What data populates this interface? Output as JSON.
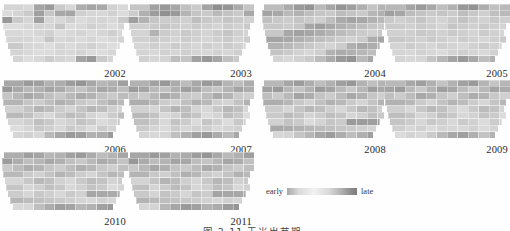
{
  "figure": {
    "caption": "图 2-11   玉米出苗期",
    "legend": {
      "low_label": "early",
      "high_label": "late",
      "ramp_low_color": "#e8e8e8",
      "ramp_high_color": "#7c7c7c"
    },
    "region_name": "Iowa",
    "panel_count": 10
  },
  "chart_data": {
    "type": "heatmap",
    "title": "图 2-11   玉米出苗期",
    "xlabel": "",
    "ylabel": "",
    "legend": {
      "position": "bottom-right",
      "entries": [
        "early",
        "late"
      ]
    },
    "colorbar": {
      "min_label": "early",
      "max_label": "late",
      "min_color": "#e8e8e8",
      "max_color": "#7c7c7c",
      "scale": "sequential-gray"
    },
    "grid": false,
    "panels": [
      {
        "label": "2002",
        "row": 0,
        "col": 0
      },
      {
        "label": "2003",
        "row": 0,
        "col": 1
      },
      {
        "label": "2004",
        "row": 0,
        "col": 2
      },
      {
        "label": "2005",
        "row": 0,
        "col": 3
      },
      {
        "label": "2006",
        "row": 1,
        "col": 0
      },
      {
        "label": "2007",
        "row": 1,
        "col": 1
      },
      {
        "label": "2008",
        "row": 1,
        "col": 2
      },
      {
        "label": "2009",
        "row": 1,
        "col": 3
      },
      {
        "label": "2010",
        "row": 2,
        "col": 0
      },
      {
        "label": "2011",
        "row": 2,
        "col": 1
      }
    ],
    "cell_values": {
      "2002": [
        0.28,
        0.22,
        0.18,
        0.62,
        0.7,
        0.3,
        0.2,
        0.55,
        0.62,
        0.58,
        0.24,
        0.18,
        0.16,
        0.22,
        0.3,
        0.66,
        0.34,
        0.58,
        0.6,
        0.26,
        0.2,
        0.18,
        0.24,
        0.16,
        0.72,
        0.3,
        0.22,
        0.64,
        0.2,
        0.18,
        0.26,
        0.16,
        0.2,
        0.22,
        0.18,
        0.3,
        0.24,
        0.14,
        0.18,
        0.22,
        0.2,
        0.34,
        0.16,
        0.18,
        0.26,
        0.2,
        0.16,
        0.22,
        0.58,
        0.18,
        0.16,
        0.2,
        0.24,
        0.14,
        0.18,
        0.22,
        0.16,
        0.2,
        0.26,
        0.18,
        0.14,
        0.22,
        0.2,
        0.16,
        0.34,
        0.18,
        0.22,
        0.16,
        0.2,
        0.14,
        0.18,
        0.22,
        0.16,
        0.3,
        0.2,
        0.18,
        0.14,
        0.22,
        0.16,
        0.2,
        0.24,
        0.18,
        0.14,
        0.16,
        0.2,
        0.22,
        0.18,
        0.14,
        0.16,
        0.2,
        0.18,
        0.22,
        0.16,
        0.14,
        0.2,
        0.18,
        0.16,
        0.22,
        0.14,
        0.18
      ],
      "2003": [
        0.4,
        0.34,
        0.64,
        0.72,
        0.6,
        0.38,
        0.3,
        0.62,
        0.8,
        0.74,
        0.56,
        0.34,
        0.28,
        0.52,
        0.68,
        0.78,
        0.7,
        0.48,
        0.34,
        0.3,
        0.44,
        0.36,
        0.3,
        0.58,
        0.66,
        0.5,
        0.34,
        0.28,
        0.3,
        0.26,
        0.4,
        0.32,
        0.28,
        0.34,
        0.3,
        0.24,
        0.28,
        0.26,
        0.3,
        0.34,
        0.28,
        0.24,
        0.3,
        0.26,
        0.22,
        0.28,
        0.24,
        0.3,
        0.26,
        0.22,
        0.5,
        0.28,
        0.24,
        0.3,
        0.26,
        0.22,
        0.28,
        0.34,
        0.26,
        0.22,
        0.28,
        0.24,
        0.3,
        0.26,
        0.22,
        0.28,
        0.24,
        0.2,
        0.26,
        0.3,
        0.22,
        0.28,
        0.24,
        0.2,
        0.26,
        0.22,
        0.28,
        0.24,
        0.2,
        0.26,
        0.22,
        0.28,
        0.24,
        0.2,
        0.26,
        0.22,
        0.18,
        0.24,
        0.2,
        0.26,
        0.22,
        0.18,
        0.24,
        0.2,
        0.26,
        0.22,
        0.18,
        0.24,
        0.2,
        0.22
      ],
      "2004": [
        0.3,
        0.42,
        0.56,
        0.7,
        0.76,
        0.44,
        0.6,
        0.74,
        0.66,
        0.52,
        0.36,
        0.48,
        0.62,
        0.58,
        0.44,
        0.5,
        0.4,
        0.34,
        0.3,
        0.42,
        0.36,
        0.3,
        0.46,
        0.52,
        0.38,
        0.32,
        0.28,
        0.34,
        0.3,
        0.26,
        0.4,
        0.56,
        0.62,
        0.58,
        0.5,
        0.44,
        0.38,
        0.32,
        0.28,
        0.34,
        0.6,
        0.66,
        0.58,
        0.52,
        0.46,
        0.4,
        0.34,
        0.3,
        0.26,
        0.32,
        0.58,
        0.64,
        0.6,
        0.54,
        0.48,
        0.42,
        0.36,
        0.3,
        0.26,
        0.32,
        0.56,
        0.62,
        0.58,
        0.52,
        0.46,
        0.4,
        0.34,
        0.28,
        0.24,
        0.3,
        0.54,
        0.6,
        0.56,
        0.5,
        0.44,
        0.38,
        0.32,
        0.26,
        0.22,
        0.28,
        0.52,
        0.58,
        0.54,
        0.48,
        0.42,
        0.36,
        0.3,
        0.24,
        0.2,
        0.26,
        0.5,
        0.56,
        0.52,
        0.46,
        0.4,
        0.34,
        0.28,
        0.22,
        0.18,
        0.24
      ],
      "2005": [
        0.34,
        0.46,
        0.62,
        0.7,
        0.58,
        0.4,
        0.52,
        0.72,
        0.76,
        0.54,
        0.38,
        0.44,
        0.66,
        0.6,
        0.42,
        0.36,
        0.3,
        0.34,
        0.28,
        0.4,
        0.32,
        0.26,
        0.38,
        0.44,
        0.3,
        0.24,
        0.28,
        0.34,
        0.26,
        0.22,
        0.3,
        0.36,
        0.28,
        0.24,
        0.32,
        0.26,
        0.22,
        0.28,
        0.24,
        0.3,
        0.26,
        0.22,
        0.34,
        0.28,
        0.24,
        0.3,
        0.26,
        0.22,
        0.28,
        0.24,
        0.26,
        0.32,
        0.28,
        0.24,
        0.3,
        0.26,
        0.22,
        0.28,
        0.24,
        0.2,
        0.26,
        0.32,
        0.28,
        0.24,
        0.3,
        0.26,
        0.22,
        0.28,
        0.24,
        0.2,
        0.26,
        0.3,
        0.26,
        0.22,
        0.28,
        0.24,
        0.2,
        0.26,
        0.22,
        0.18,
        0.24,
        0.28,
        0.24,
        0.2,
        0.26,
        0.22,
        0.18,
        0.24,
        0.2,
        0.16,
        0.22,
        0.26,
        0.22,
        0.18,
        0.24,
        0.2,
        0.16,
        0.22,
        0.18,
        0.2
      ],
      "2006": [
        0.44,
        0.58,
        0.7,
        0.66,
        0.5,
        0.54,
        0.68,
        0.74,
        0.6,
        0.46,
        0.52,
        0.64,
        0.72,
        0.58,
        0.44,
        0.5,
        0.62,
        0.56,
        0.42,
        0.36,
        0.48,
        0.6,
        0.54,
        0.4,
        0.34,
        0.46,
        0.58,
        0.52,
        0.38,
        0.32,
        0.44,
        0.56,
        0.5,
        0.36,
        0.3,
        0.42,
        0.54,
        0.48,
        0.34,
        0.28,
        0.4,
        0.52,
        0.46,
        0.32,
        0.26,
        0.38,
        0.5,
        0.44,
        0.3,
        0.24,
        0.36,
        0.48,
        0.42,
        0.28,
        0.22,
        0.34,
        0.46,
        0.4,
        0.26,
        0.2,
        0.32,
        0.44,
        0.38,
        0.24,
        0.18,
        0.3,
        0.42,
        0.36,
        0.22,
        0.16,
        0.28,
        0.4,
        0.34,
        0.2,
        0.26,
        0.38,
        0.32,
        0.18,
        0.24,
        0.36,
        0.3,
        0.16,
        0.22,
        0.34,
        0.28,
        0.14,
        0.2,
        0.32,
        0.26,
        0.18,
        0.3,
        0.24,
        0.16,
        0.28,
        0.22,
        0.14,
        0.26,
        0.2,
        0.24,
        0.18
      ],
      "2007": [
        0.38,
        0.5,
        0.64,
        0.72,
        0.56,
        0.42,
        0.58,
        0.7,
        0.66,
        0.48,
        0.4,
        0.54,
        0.68,
        0.62,
        0.44,
        0.38,
        0.52,
        0.66,
        0.58,
        0.4,
        0.34,
        0.48,
        0.62,
        0.54,
        0.36,
        0.3,
        0.44,
        0.58,
        0.5,
        0.32,
        0.28,
        0.42,
        0.56,
        0.48,
        0.3,
        0.26,
        0.4,
        0.54,
        0.46,
        0.28,
        0.24,
        0.38,
        0.52,
        0.44,
        0.26,
        0.22,
        0.36,
        0.5,
        0.42,
        0.24,
        0.2,
        0.34,
        0.48,
        0.4,
        0.22,
        0.18,
        0.32,
        0.46,
        0.38,
        0.2,
        0.26,
        0.44,
        0.36,
        0.18,
        0.24,
        0.42,
        0.34,
        0.16,
        0.22,
        0.4,
        0.32,
        0.14,
        0.2,
        0.38,
        0.3,
        0.18,
        0.36,
        0.28,
        0.16,
        0.34,
        0.26,
        0.14,
        0.32,
        0.24,
        0.18,
        0.3,
        0.22,
        0.16,
        0.28,
        0.2,
        0.24,
        0.26,
        0.18,
        0.22,
        0.24,
        0.16,
        0.2,
        0.22,
        0.18,
        0.2
      ],
      "2008": [
        0.34,
        0.46,
        0.6,
        0.68,
        0.54,
        0.4,
        0.52,
        0.66,
        0.72,
        0.5,
        0.38,
        0.48,
        0.64,
        0.7,
        0.46,
        0.36,
        0.5,
        0.68,
        0.62,
        0.44,
        0.32,
        0.46,
        0.66,
        0.58,
        0.4,
        0.3,
        0.44,
        0.62,
        0.54,
        0.36,
        0.28,
        0.42,
        0.58,
        0.5,
        0.34,
        0.26,
        0.4,
        0.54,
        0.46,
        0.32,
        0.24,
        0.38,
        0.5,
        0.44,
        0.3,
        0.22,
        0.36,
        0.48,
        0.42,
        0.28,
        0.2,
        0.34,
        0.46,
        0.4,
        0.26,
        0.18,
        0.32,
        0.44,
        0.38,
        0.24,
        0.16,
        0.3,
        0.42,
        0.36,
        0.22,
        0.28,
        0.4,
        0.34,
        0.2,
        0.26,
        0.38,
        0.32,
        0.18,
        0.24,
        0.36,
        0.3,
        0.16,
        0.22,
        0.34,
        0.28,
        0.7,
        0.68,
        0.66,
        0.64,
        0.62,
        0.58,
        0.54,
        0.5,
        0.46,
        0.42,
        0.38,
        0.34,
        0.3,
        0.26,
        0.22,
        0.18,
        0.24,
        0.2,
        0.22
      ],
      "2009": [
        0.3,
        0.44,
        0.58,
        0.66,
        0.52,
        0.36,
        0.5,
        0.64,
        0.7,
        0.48,
        0.34,
        0.46,
        0.62,
        0.68,
        0.44,
        0.32,
        0.48,
        0.66,
        0.6,
        0.42,
        0.3,
        0.44,
        0.62,
        0.56,
        0.38,
        0.28,
        0.42,
        0.58,
        0.52,
        0.34,
        0.26,
        0.4,
        0.54,
        0.48,
        0.32,
        0.24,
        0.38,
        0.5,
        0.44,
        0.3,
        0.22,
        0.36,
        0.48,
        0.42,
        0.28,
        0.2,
        0.34,
        0.46,
        0.4,
        0.26,
        0.18,
        0.32,
        0.44,
        0.38,
        0.24,
        0.16,
        0.3,
        0.42,
        0.36,
        0.22,
        0.28,
        0.4,
        0.34,
        0.2,
        0.26,
        0.38,
        0.32,
        0.18,
        0.24,
        0.36,
        0.3,
        0.16,
        0.22,
        0.34,
        0.28,
        0.2,
        0.32,
        0.26,
        0.18,
        0.3,
        0.24,
        0.16,
        0.28,
        0.22,
        0.2,
        0.26,
        0.18,
        0.24,
        0.16,
        0.22,
        0.2,
        0.18,
        0.24,
        0.16,
        0.22,
        0.18,
        0.2,
        0.16,
        0.22,
        0.18
      ],
      "2010": [
        0.4,
        0.54,
        0.66,
        0.62,
        0.46,
        0.5,
        0.64,
        0.7,
        0.56,
        0.42,
        0.48,
        0.6,
        0.68,
        0.54,
        0.4,
        0.46,
        0.58,
        0.52,
        0.38,
        0.32,
        0.44,
        0.56,
        0.5,
        0.36,
        0.3,
        0.42,
        0.54,
        0.48,
        0.34,
        0.28,
        0.4,
        0.52,
        0.46,
        0.32,
        0.26,
        0.38,
        0.5,
        0.44,
        0.3,
        0.24,
        0.36,
        0.48,
        0.42,
        0.28,
        0.22,
        0.34,
        0.46,
        0.4,
        0.26,
        0.2,
        0.32,
        0.44,
        0.38,
        0.24,
        0.18,
        0.3,
        0.42,
        0.36,
        0.22,
        0.28,
        0.4,
        0.34,
        0.2,
        0.26,
        0.38,
        0.32,
        0.18,
        0.24,
        0.36,
        0.3,
        0.16,
        0.22,
        0.34,
        0.28,
        0.2,
        0.32,
        0.26,
        0.18,
        0.3,
        0.24,
        0.6,
        0.58,
        0.56,
        0.54,
        0.5,
        0.46,
        0.42,
        0.38,
        0.34,
        0.3,
        0.26,
        0.22,
        0.18,
        0.24,
        0.2,
        0.16,
        0.22,
        0.18,
        0.2
      ],
      "2011": [
        0.46,
        0.6,
        0.7,
        0.64,
        0.5,
        0.56,
        0.68,
        0.74,
        0.58,
        0.44,
        0.52,
        0.66,
        0.72,
        0.56,
        0.42,
        0.48,
        0.62,
        0.58,
        0.4,
        0.34,
        0.46,
        0.6,
        0.54,
        0.38,
        0.32,
        0.44,
        0.58,
        0.52,
        0.36,
        0.3,
        0.42,
        0.56,
        0.5,
        0.34,
        0.28,
        0.4,
        0.54,
        0.48,
        0.32,
        0.26,
        0.38,
        0.52,
        0.46,
        0.3,
        0.24,
        0.36,
        0.5,
        0.44,
        0.28,
        0.22,
        0.34,
        0.48,
        0.42,
        0.26,
        0.2,
        0.32,
        0.46,
        0.4,
        0.24,
        0.3,
        0.44,
        0.38,
        0.22,
        0.28,
        0.42,
        0.36,
        0.2,
        0.26,
        0.4,
        0.34,
        0.18,
        0.24,
        0.38,
        0.32,
        0.22,
        0.36,
        0.3,
        0.2,
        0.34,
        0.28,
        0.62,
        0.6,
        0.58,
        0.56,
        0.52,
        0.48,
        0.44,
        0.4,
        0.36,
        0.32,
        0.28,
        0.24,
        0.2,
        0.26,
        0.22,
        0.18,
        0.24,
        0.2,
        0.22
      ]
    }
  }
}
